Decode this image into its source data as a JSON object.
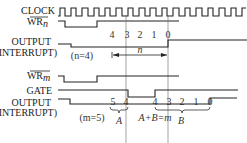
{
  "diagram": {
    "signals": [
      {
        "id": "clock",
        "label": "CLOCK"
      },
      {
        "id": "wr_n",
        "label": "WR",
        "subscript": "n",
        "overline": true
      },
      {
        "id": "output_n",
        "label_line1": "OUTPUT",
        "label_line2": "(INTERRUPT)"
      },
      {
        "id": "wr_m",
        "label": "WR",
        "subscript": "m",
        "overline": true
      },
      {
        "id": "gate",
        "label": "GATE"
      },
      {
        "id": "output_m",
        "label_line1": "OUTPUT",
        "label_line2": "(INTERRUPT)"
      }
    ],
    "counts_n": [
      "4",
      "3",
      "2",
      "1",
      "0"
    ],
    "counts_m": [
      "5",
      "4",
      "4",
      "3",
      "2",
      "1",
      "0"
    ],
    "n_note": "(n=4)",
    "n_span_label": "n",
    "m_note": "(m=5)",
    "brace_a_label": "A",
    "brace_b_label": "B",
    "sum_label": "A+B=m"
  }
}
